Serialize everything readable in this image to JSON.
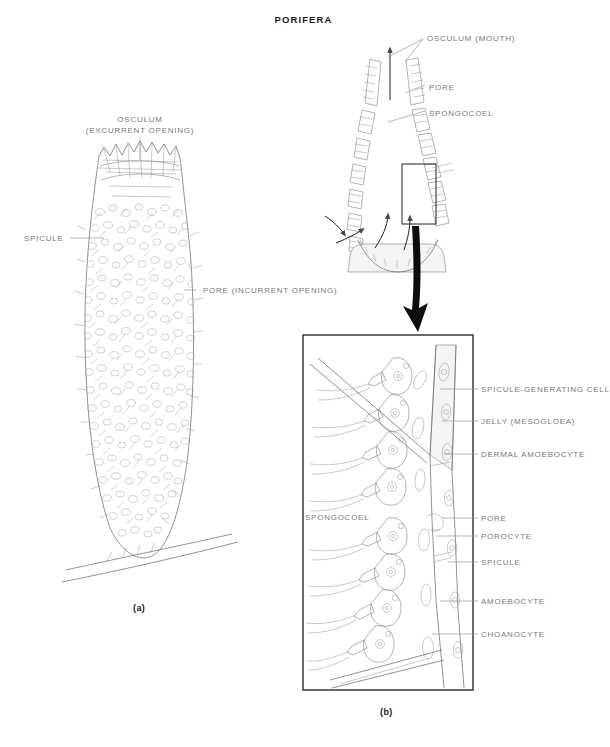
{
  "figure": {
    "title": "PORIFERA",
    "captions": {
      "a": "(a)",
      "b": "(b)"
    }
  },
  "panel_a": {
    "name": "whole-sponge-external-view",
    "labels": [
      {
        "id": "osculum",
        "line1": "OSCULUM",
        "line2": "(EXCURRENT OPENING)",
        "x": 62,
        "y": 118
      },
      {
        "id": "spicule",
        "text": "SPICULE",
        "x": 24,
        "y": 233
      },
      {
        "id": "pore",
        "text": "PORE (INCURRENT OPENING)",
        "x": 203,
        "y": 286
      }
    ]
  },
  "panel_b_cutaway": {
    "name": "sponge-cross-section",
    "labels": [
      {
        "id": "osculum-mouth",
        "text": "OSCULUM (MOUTH)",
        "x": 427,
        "y": 36
      },
      {
        "id": "pore",
        "text": "PORE",
        "x": 429,
        "y": 82
      },
      {
        "id": "spongocoel",
        "text": "SPONGOCOEL",
        "x": 429,
        "y": 108
      }
    ]
  },
  "panel_b_detail": {
    "name": "body-wall-detail-box",
    "interior_label": {
      "id": "spongocoel",
      "text": "SPONGOCOEL",
      "x": 305,
      "y": 512
    },
    "labels": [
      {
        "id": "spicule-generating-cell",
        "text": "SPICULE-GENERATING CELL",
        "x": 481,
        "y": 385
      },
      {
        "id": "jelly-mesogloea",
        "text": "JELLY  (MESOGLOEA)",
        "x": 481,
        "y": 417
      },
      {
        "id": "dermal-amoebocyte",
        "text": "DERMAL  AMOEBOCYTE",
        "x": 481,
        "y": 450
      },
      {
        "id": "pore",
        "text": "PORE",
        "x": 481,
        "y": 514
      },
      {
        "id": "porocyte",
        "text": "POROCYTE",
        "x": 481,
        "y": 532
      },
      {
        "id": "spicule",
        "text": "SPICULE",
        "x": 481,
        "y": 558
      },
      {
        "id": "amoebocyte",
        "text": "AMOEBOCYTE",
        "x": 481,
        "y": 597
      },
      {
        "id": "choanocyte",
        "text": "CHOANOCYTE",
        "x": 481,
        "y": 630
      }
    ]
  },
  "colors": {
    "ink": "#6e6e6e",
    "label_text": "#7a7a7a",
    "title_text": "#1a1a1a",
    "box_border": "#2a2a2a",
    "background": "#ffffff"
  }
}
